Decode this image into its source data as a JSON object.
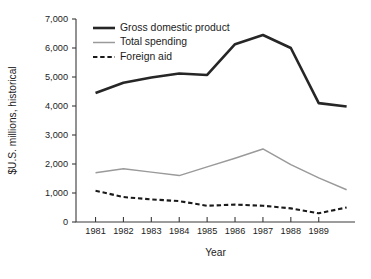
{
  "chart_data": {
    "type": "line",
    "title": "",
    "xlabel": "Year",
    "ylabel": "$U.S. millions, historical",
    "x": [
      1981,
      1982,
      1983,
      1984,
      1985,
      1986,
      1987,
      1988,
      1989,
      1990
    ],
    "categories": [
      "1981",
      "1982",
      "1983",
      "1984",
      "1985",
      "1986",
      "1987",
      "1988",
      "1989",
      ""
    ],
    "xticklabels": [
      "1981",
      "1982",
      "1983",
      "1984",
      "1985",
      "1986",
      "1987",
      "1988",
      "1989"
    ],
    "yticklabels": [
      "0",
      "1,000",
      "2,000",
      "3,000",
      "4,000",
      "5,000",
      "6,000",
      "7,000"
    ],
    "yticks": [
      0,
      1000,
      2000,
      3000,
      4000,
      5000,
      6000,
      7000
    ],
    "ylim": [
      0,
      7000
    ],
    "xlim": [
      1980.3,
      1990.3
    ],
    "grid": false,
    "legend_position": "top-left",
    "series": [
      {
        "name": "Gross domestic product",
        "style": "solid-thick",
        "color": "#262626",
        "width": 2.6,
        "values": [
          4450,
          4800,
          4980,
          5120,
          5070,
          6130,
          6450,
          6000,
          4100,
          3980
        ]
      },
      {
        "name": "Total spending",
        "style": "solid-thin",
        "color": "#9a9a9a",
        "width": 1.5,
        "values": [
          1700,
          1840,
          1720,
          1600,
          1900,
          2200,
          2520,
          1980,
          1520,
          1110
        ]
      },
      {
        "name": "Foreign aid",
        "style": "dashed",
        "color": "#1a1a1a",
        "width": 2.1,
        "values": [
          1080,
          860,
          780,
          720,
          560,
          600,
          560,
          470,
          300,
          500
        ]
      }
    ]
  }
}
